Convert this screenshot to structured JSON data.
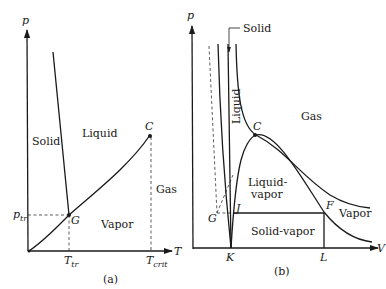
{
  "panel_a": {
    "caption": "(a)",
    "axis_y": "p",
    "axis_x": "T",
    "regions": {
      "solid": "Solid",
      "liquid": "Liquid",
      "vapor": "Vapor",
      "gas": "Gas"
    },
    "points": {
      "critical": "C",
      "triple": "G"
    },
    "ticks": {
      "p_tr_main": "p",
      "p_tr_sub": "tr",
      "T_tr_main": "T",
      "T_tr_sub": "tr",
      "T_crit_main": "T",
      "T_crit_sub": "crit"
    }
  },
  "panel_b": {
    "caption": "(b)",
    "axis_y": "p",
    "axis_x": "V",
    "regions": {
      "solid": "Solid",
      "liquid": "Liquid",
      "gas": "Gas",
      "liquid_vapor_1": "Liquid-",
      "liquid_vapor_2": "vapor",
      "vapor": "Vapor",
      "solid_vapor": "Solid-vapor"
    },
    "points": {
      "critical": "C",
      "G": "G",
      "J": "J",
      "F": "F",
      "K": "K",
      "L": "L"
    }
  }
}
